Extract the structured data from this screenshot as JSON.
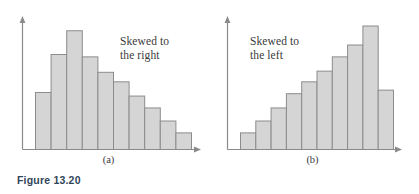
{
  "figure": {
    "caption": "Figure 13.20",
    "caption_color": "#2f4558",
    "background": "#ffffff",
    "axis_color": "#8a8a8a",
    "bar_fill": "#d5d5d5",
    "bar_stroke": "#8c8c8c"
  },
  "panels": [
    {
      "id": "a",
      "label": "(a)",
      "annotation_line1": "Skewed to",
      "annotation_line2": "the right"
    },
    {
      "id": "b",
      "label": "(b)",
      "annotation_line1": "Skewed to",
      "annotation_line2": "the left"
    }
  ],
  "chart_data": [
    {
      "type": "bar",
      "title": "(a)",
      "annotation": "Skewed to the right",
      "xlabel": "",
      "ylabel": "",
      "grid": false,
      "legend": "none",
      "axis_arrows": true,
      "tick_labels": [],
      "categories": [
        "1",
        "2",
        "3",
        "4",
        "5",
        "6",
        "7",
        "8",
        "9",
        "10"
      ],
      "values": [
        48,
        80,
        100,
        78,
        65,
        57,
        45,
        35,
        24,
        14
      ],
      "ylim": [
        0,
        112
      ],
      "bar_fill": "#d5d5d5",
      "bar_stroke": "#8c8c8c"
    },
    {
      "type": "bar",
      "title": "(b)",
      "annotation": "Skewed to the left",
      "xlabel": "",
      "ylabel": "",
      "grid": false,
      "legend": "none",
      "axis_arrows": true,
      "tick_labels": [],
      "categories": [
        "1",
        "2",
        "3",
        "4",
        "5",
        "6",
        "7",
        "8",
        "9",
        "10"
      ],
      "values": [
        14,
        24,
        35,
        47,
        57,
        66,
        78,
        88,
        104,
        50
      ],
      "ylim": [
        0,
        112
      ],
      "bar_fill": "#d5d5d5",
      "bar_stroke": "#8c8c8c"
    }
  ]
}
